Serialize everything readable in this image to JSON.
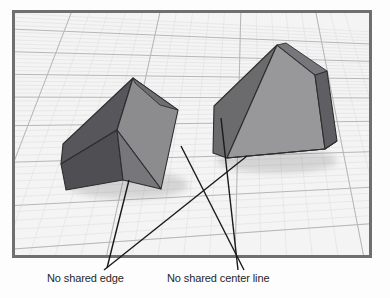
{
  "scene": {
    "title": "3D viewport with two polyhedra on a perspective grid",
    "frame": {
      "border_color": "#6f6f70",
      "background_color": "#f2f2f2",
      "x": 12,
      "y": 10,
      "width": 360,
      "height": 248
    },
    "grid": {
      "minor_line_color": "#dedede",
      "major_line_color": "#b9b9b9",
      "minor_cells_per_major": 5,
      "perspective": true
    },
    "objects": [
      {
        "name": "wedge-left",
        "label": "left wedge solid",
        "shaded_face_color": "#555556",
        "lit_face_color": "#8b8b8c",
        "mid_face_color": "#747475",
        "edge_color": "#2b2b2b",
        "apex": [
          133,
          78
        ]
      },
      {
        "name": "pyramid-right",
        "label": "right pyramid solid",
        "shaded_face_color": "#6a6a6b",
        "lit_face_color": "#989899",
        "mid_face_color": "#5d5d5e",
        "edge_color": "#2b2b2b",
        "apex": [
          277,
          45
        ]
      }
    ],
    "leaders": {
      "line_color": "#1a1a1a",
      "line_width": 1.4
    }
  },
  "annotations": [
    {
      "id": "no-shared-edge",
      "text": "No shared edge",
      "text_x": 47,
      "text_y": 272
    },
    {
      "id": "no-shared-center-line",
      "text": "No shared center line",
      "text_x": 167,
      "text_y": 272
    }
  ],
  "colors": {
    "page_background": "#ffffff",
    "text": "#262626"
  }
}
